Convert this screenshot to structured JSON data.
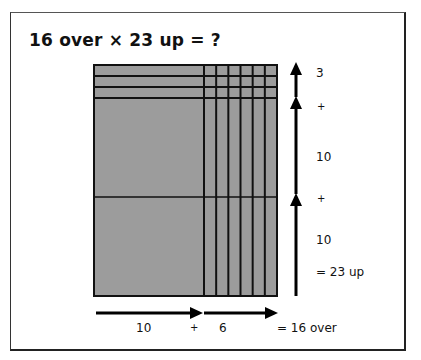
{
  "title": "16 over × 23 up = ?",
  "colors": {
    "grid_fill": "#9c9c9c",
    "grid_line": "#111111",
    "arrow": "#000000"
  },
  "grid": {
    "total_over": 16,
    "total_up": 23,
    "over_parts": [
      10,
      6
    ],
    "up_parts": [
      3,
      10,
      10
    ],
    "thin_rows": 3,
    "thin_cols": 6
  },
  "vertical_labels": {
    "part1": "3",
    "plus1": "+",
    "part2": "10",
    "plus2": "+",
    "part3": "10",
    "result": "= 23 up"
  },
  "horizontal_labels": {
    "part1": "10",
    "plus": "+",
    "part2": "6",
    "result": "= 16 over"
  },
  "icons": {
    "up_arrow": "arrow-up-icon",
    "right_arrow": "arrow-right-icon"
  }
}
